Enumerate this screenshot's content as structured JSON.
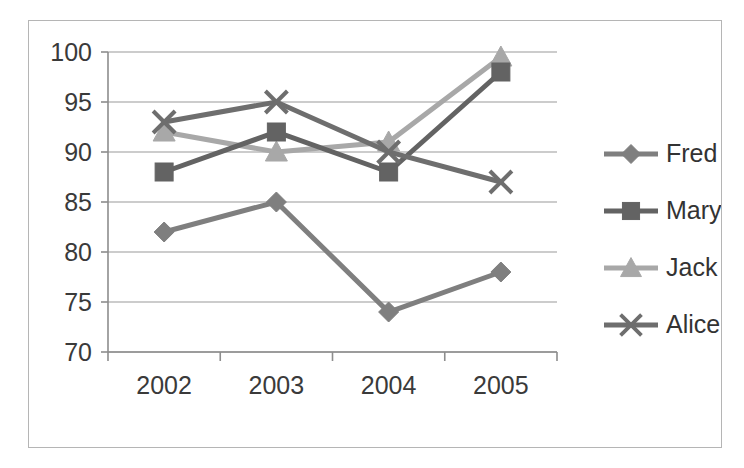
{
  "chart_data": {
    "type": "line",
    "title": "",
    "subtitle": "",
    "xlabel": "",
    "ylabel": "",
    "categories": [
      "2002",
      "2003",
      "2004",
      "2005"
    ],
    "ylim": [
      70,
      100
    ],
    "y_ticks": [
      70,
      75,
      80,
      85,
      90,
      95,
      100
    ],
    "y_tick_labels": [
      "70",
      "75",
      "80",
      "85",
      "90",
      "95",
      "100"
    ],
    "grid": true,
    "legend_position": "right",
    "series": [
      {
        "name": "Fred",
        "marker": "diamond",
        "color": "#7f7f7f",
        "values": [
          82,
          85,
          74,
          78
        ]
      },
      {
        "name": "Mary",
        "marker": "square",
        "color": "#636363",
        "values": [
          88,
          92,
          88,
          98
        ]
      },
      {
        "name": "Jack",
        "marker": "triangle",
        "color": "#a8a8a8",
        "values": [
          92,
          90,
          91,
          99.5
        ]
      },
      {
        "name": "Alice",
        "marker": "x",
        "color": "#6e6e6e",
        "values": [
          93,
          95,
          90,
          87
        ]
      }
    ]
  },
  "legend": {
    "items": [
      {
        "label": "Fred"
      },
      {
        "label": "Mary"
      },
      {
        "label": "Jack"
      },
      {
        "label": "Alice"
      }
    ]
  },
  "axes": {
    "x_tick_labels": [
      "2002",
      "2003",
      "2004",
      "2005"
    ],
    "y_tick_labels": [
      "100",
      "95",
      "90",
      "85",
      "80",
      "75",
      "70"
    ]
  },
  "colors": {
    "plot_background": "#ffffff",
    "border": "#b5b5b5",
    "gridline": "#9a9a9a",
    "axis": "#8d8d8d",
    "text": "#3a3a3a"
  }
}
